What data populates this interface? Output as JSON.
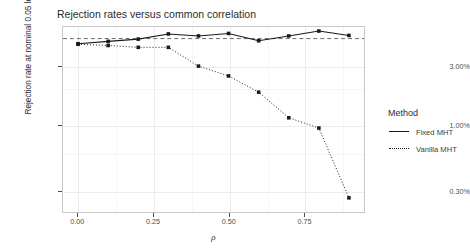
{
  "chart_data": {
    "type": "line",
    "title": "Rejection rates versus common correlation",
    "xlabel": "ρ",
    "ylabel": "Rejection rate at nominal 0.05 level",
    "x": [
      0.0,
      0.1,
      0.2,
      0.3,
      0.4,
      0.5,
      0.6,
      0.7,
      0.8,
      0.9
    ],
    "xlim": [
      -0.05,
      0.95
    ],
    "ylim_percent": [
      0.2,
      6.2
    ],
    "yscale": "log",
    "grid": true,
    "legend_position": "right",
    "legend_title": "Method",
    "xticks": [
      "0.00",
      "0.25",
      "0.50",
      "0.75"
    ],
    "xtick_values": [
      0.0,
      0.25,
      0.5,
      0.75
    ],
    "yticks": [
      "3.00%",
      "1.00%",
      "0.30%"
    ],
    "ytick_values": [
      3.0,
      1.0,
      0.3
    ],
    "reference_line": {
      "type": "hline",
      "value_percent": 5.0,
      "style": "dashed",
      "color": "#555555"
    },
    "series": [
      {
        "name": "Fixed MHT",
        "style": "solid",
        "marker": "filled-square",
        "color": "#1a1a1a",
        "values_percent": [
          4.55,
          4.75,
          4.95,
          5.45,
          5.25,
          5.5,
          4.8,
          5.25,
          5.75,
          5.3
        ]
      },
      {
        "name": "Vanilla MHT",
        "style": "dotted",
        "marker": "filled-square",
        "color": "#1a1a1a",
        "values_percent": [
          4.5,
          4.4,
          4.25,
          4.25,
          3.0,
          2.5,
          1.85,
          1.15,
          0.95,
          0.26
        ]
      }
    ]
  },
  "legend": {
    "title": "Method",
    "entries": [
      {
        "label": "Fixed MHT",
        "style": "solid"
      },
      {
        "label": "Vanilla MHT",
        "style": "dotted"
      }
    ]
  }
}
